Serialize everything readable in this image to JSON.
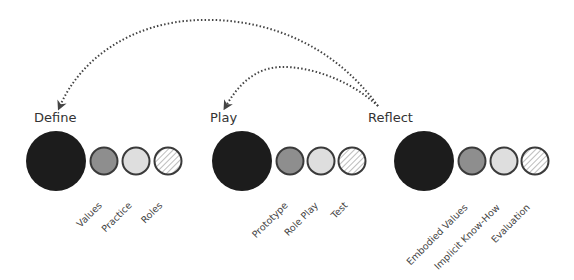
{
  "diagram": {
    "colors": {
      "big": "#1c1c1c",
      "stroke": "#3a3a3a",
      "dark_gray": "#8e8e8e",
      "light_gray": "#dedede",
      "hatch": "#9a9a9a",
      "arrow": "#444444"
    },
    "stages": [
      {
        "title": "Define",
        "items": [
          "Values",
          "Practice",
          "Roles"
        ]
      },
      {
        "title": "Play",
        "items": [
          "Prototype",
          "Role Play",
          "Test"
        ]
      },
      {
        "title": "Reflect",
        "items": [
          "Embodied Values",
          "Implicit Know-How",
          "Evaluation"
        ]
      }
    ],
    "arrows": [
      {
        "from": "Reflect",
        "to": "Define",
        "style": "dotted"
      },
      {
        "from": "Reflect",
        "to": "Play",
        "style": "dotted"
      }
    ]
  }
}
